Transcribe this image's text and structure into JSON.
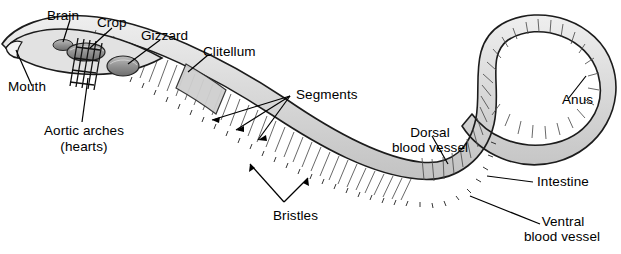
{
  "figure": {
    "background_color": "#ffffff",
    "text_color": "#000000",
    "body_fill_color": "#d9d9d9",
    "body_outline_color": "#1a1a1a",
    "organ_fill_color": "#9e9e9e",
    "width": 621,
    "height": 254
  },
  "labels": {
    "brain": "Brain",
    "crop": "Crop",
    "gizzard": "Gizzard",
    "clitellum": "Clitellum",
    "segments": "Segments",
    "mouth": "Mouth",
    "aortic_arches_line1": "Aortic arches",
    "aortic_arches_line2": "(hearts)",
    "bristles": "Bristles",
    "dorsal_line1": "Dorsal",
    "dorsal_line2": "blood vessel",
    "intestine": "Intestine",
    "ventral_line1": "Ventral",
    "ventral_line2": "blood vessel",
    "anus": "Anus"
  }
}
